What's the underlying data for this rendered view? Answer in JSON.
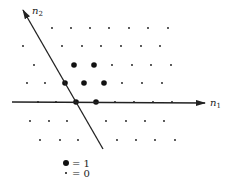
{
  "diagram": {
    "axis_x": {
      "label": "n",
      "sub": "1",
      "from": [
        12,
        102
      ],
      "to": [
        205,
        103
      ]
    },
    "axis_y": {
      "label": "n",
      "sub": "2",
      "from": [
        103,
        149
      ],
      "to": [
        23,
        10
      ]
    },
    "lattice": [
      {
        "y": 28,
        "x": [
          52,
          71,
          90,
          109,
          129,
          148,
          168
        ],
        "big": []
      },
      {
        "y": 46,
        "x": [
          23,
          62,
          82,
          101,
          121,
          141,
          160
        ],
        "big": []
      },
      {
        "y": 65,
        "x": [
          34,
          74,
          94,
          112,
          132,
          151,
          171
        ],
        "big": [
          74,
          94
        ]
      },
      {
        "y": 83,
        "x": [
          27,
          45,
          65,
          84,
          104,
          122,
          142,
          162
        ],
        "big": [
          65,
          84,
          104
        ]
      },
      {
        "y": 102,
        "x": [
          38,
          56,
          76,
          96,
          115,
          134,
          153,
          172
        ],
        "big": [
          76,
          96
        ]
      },
      {
        "y": 121,
        "x": [
          30,
          49,
          67,
          106,
          126,
          145,
          164
        ],
        "big": []
      },
      {
        "y": 140,
        "x": [
          40,
          60,
          78,
          117,
          136,
          155,
          175
        ],
        "big": []
      }
    ],
    "legend": [
      {
        "symbol": "large-dot",
        "text": "= 1"
      },
      {
        "symbol": "small-dot",
        "text": "= 0"
      }
    ]
  }
}
